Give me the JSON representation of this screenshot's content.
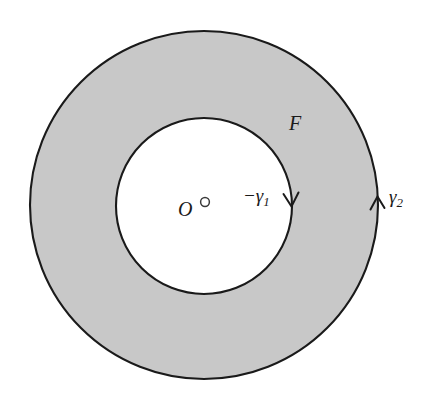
{
  "figure": {
    "type": "annulus-contour-diagram",
    "background_color": "#ffffff",
    "region_fill_color": "#c8c8c8",
    "curve_color": "#1a1a1a",
    "center": {
      "x": 204,
      "y": 205
    },
    "outer_circle": {
      "radius": 174,
      "orientation": "counterclockwise"
    },
    "inner_circle": {
      "radius": 88,
      "orientation": "clockwise"
    },
    "origin_marker": {
      "x": 205,
      "y": 203,
      "radius": 4,
      "filled": false
    }
  },
  "labels": {
    "region": "F",
    "origin": "O",
    "inner_curve_prefix": "−γ",
    "inner_curve_subscript": "1",
    "outer_curve_prefix": "γ",
    "outer_curve_subscript": "2"
  },
  "arrows": {
    "inner": {
      "direction": "down",
      "x": 291,
      "y": 203
    },
    "outer": {
      "direction": "up",
      "x": 377,
      "y": 203
    }
  }
}
